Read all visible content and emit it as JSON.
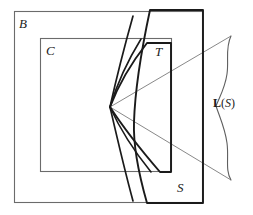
{
  "figure": {
    "type": "mathematical-set-diagram",
    "caption": "",
    "colors": {
      "stroke_thin": "#6b6b6b",
      "stroke_bold": "#1a1a1a",
      "background": "#ffffff"
    },
    "labels": {
      "b": "B",
      "c": "C",
      "t": "T",
      "s": "S",
      "ls_l": "L",
      "ls_open": "(",
      "ls_s": "S",
      "ls_close": ")"
    },
    "shapes": {
      "outer_rect_b": {
        "name": "B",
        "x": 14,
        "y": 11,
        "width": 189,
        "height": 192,
        "stroke": "thin"
      },
      "inner_rect_c": {
        "name": "C",
        "x": 40,
        "y": 38,
        "width": 132,
        "height": 134,
        "stroke": "thin"
      },
      "region_s": {
        "name": "S",
        "left_curve": true,
        "right_x": 203,
        "top_y": 10,
        "bottom_y": 203,
        "stroke": "bold"
      },
      "region_t": {
        "name": "T",
        "apex_x": 110,
        "apex_y": 107,
        "right_x": 171,
        "top_y": 43,
        "bottom_y": 172,
        "stroke": "bold"
      },
      "focal_point": {
        "x": 110,
        "y": 107
      },
      "brace_ls": {
        "name": "L(S)",
        "top_x": 231,
        "top_y": 36,
        "bottom_x": 231,
        "bottom_y": 180
      },
      "cone_lines": 2,
      "fan_curves": 4
    }
  }
}
